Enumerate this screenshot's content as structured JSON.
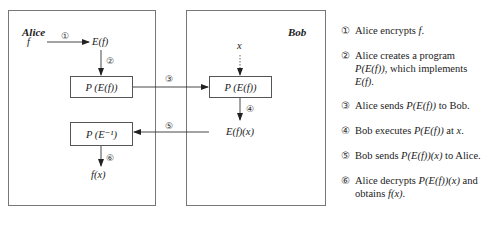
{
  "diagram": {
    "alice": {
      "title": "Alice",
      "input": "f",
      "encrypted": "E(f)",
      "program_box": "P (E(f))",
      "decrypt_box": "P (E⁻¹)",
      "result": "f(x)"
    },
    "bob": {
      "title": "Bob",
      "input": "x",
      "program_box": "P (E(f))",
      "output": "E(f)(x)"
    },
    "step_markers": {
      "s1": "①",
      "s2": "②",
      "s3": "③",
      "s4": "④",
      "s5": "⑤",
      "s6": "⑥"
    }
  },
  "legend": [
    {
      "num": "①",
      "parts": [
        "Alice encrypts ",
        "f",
        "."
      ]
    },
    {
      "num": "②",
      "parts": [
        "Alice creates a program ",
        "P(E(f))",
        ", which implements ",
        "E(f)",
        "."
      ]
    },
    {
      "num": "③",
      "parts": [
        "Alice sends ",
        "P(E(f))",
        " to Bob."
      ]
    },
    {
      "num": "④",
      "parts": [
        "Bob executes ",
        "P(E(f))",
        " at ",
        "x",
        "."
      ]
    },
    {
      "num": "⑤",
      "parts": [
        "Bob sends ",
        "P(E(f))(x)",
        " to Alice."
      ]
    },
    {
      "num": "⑥",
      "parts": [
        "Alice decrypts ",
        "P(E(f))(x)",
        " and obtains ",
        "f(x)",
        "."
      ]
    }
  ]
}
